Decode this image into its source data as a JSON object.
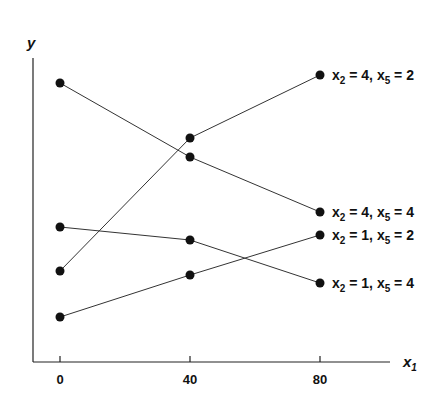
{
  "chart_data": {
    "type": "line",
    "title": "",
    "xlabel": "x1",
    "ylabel": "y",
    "x": [
      0,
      40,
      80
    ],
    "xticks": [
      "0",
      "40",
      "80"
    ],
    "yticks": [],
    "grid": false,
    "legend_position": "inline-right",
    "note": "y-axis has no ticks; y values are relative heights above x-axis (pixel units)",
    "series": [
      {
        "name": "x2 = 4, x5 = 2",
        "label_main": "x",
        "sub1": "2",
        "mid": " = 4, x",
        "sub2": "5",
        "tail": " = 2",
        "values": [
          91,
          224,
          287
        ]
      },
      {
        "name": "x2 = 4, x5 = 4",
        "label_main": "x",
        "sub1": "2",
        "mid": " = 4, x",
        "sub2": "5",
        "tail": " = 4",
        "values": [
          279,
          205,
          150
        ]
      },
      {
        "name": "x2 = 1, x5 = 2",
        "label_main": "x",
        "sub1": "2",
        "mid": " = 1, x",
        "sub2": "5",
        "tail": " = 2",
        "values": [
          45,
          87,
          127
        ]
      },
      {
        "name": "x2 = 1, x5 = 4",
        "label_main": "x",
        "sub1": "2",
        "mid": " = 1, x",
        "sub2": "5",
        "tail": " = 4",
        "values": [
          135,
          122,
          79
        ]
      }
    ],
    "colors": {
      "line": "#333333",
      "marker": "#111111",
      "axis": "#222222"
    }
  }
}
